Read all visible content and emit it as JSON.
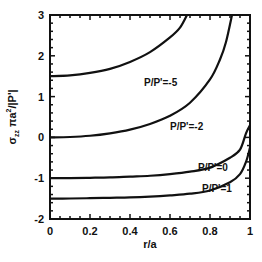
{
  "chart_data": {
    "type": "line",
    "title": "",
    "xlabel": "r/a",
    "ylabel": "σzz πa²/|P'|",
    "ylabel_parts": {
      "sigma": "σ",
      "sub": "zz",
      "mid": " πa",
      "sup": "2",
      "end": "/|P'|"
    },
    "xlim": [
      0,
      1
    ],
    "ylim": [
      -2,
      3
    ],
    "xticks": [
      0,
      0.2,
      0.4,
      0.6,
      0.8,
      1
    ],
    "xtick_labels": [
      "0",
      "0.2",
      "0.4",
      "0.6",
      "0.8",
      "1"
    ],
    "yticks": [
      -2,
      -1,
      0,
      1,
      2,
      3
    ],
    "ytick_labels": [
      "-2",
      "-1",
      "0",
      "1",
      "2",
      "3"
    ],
    "grid": false,
    "legend": "inline labels",
    "series": [
      {
        "name": "P/P'=-5",
        "label": "P/P'=-5",
        "x": [
          0,
          0.1,
          0.2,
          0.3,
          0.4,
          0.5,
          0.6,
          0.65,
          0.685
        ],
        "y": [
          1.5,
          1.52,
          1.58,
          1.68,
          1.85,
          2.09,
          2.45,
          2.69,
          3.0
        ]
      },
      {
        "name": "P/P'=-2",
        "label": "P/P'=-2",
        "x": [
          0,
          0.1,
          0.2,
          0.3,
          0.4,
          0.5,
          0.6,
          0.7,
          0.8,
          0.85,
          0.88,
          0.91
        ],
        "y": [
          0,
          0.01,
          0.04,
          0.1,
          0.19,
          0.33,
          0.53,
          0.85,
          1.42,
          1.91,
          2.34,
          3.0
        ]
      },
      {
        "name": "P/P'=0",
        "label": "P/P'=0",
        "x": [
          0,
          0.1,
          0.2,
          0.3,
          0.4,
          0.5,
          0.6,
          0.7,
          0.8,
          0.9,
          0.95,
          0.98,
          1.0
        ],
        "y": [
          -1,
          -0.998,
          -0.99,
          -0.98,
          -0.96,
          -0.94,
          -0.9,
          -0.84,
          -0.74,
          -0.5,
          -0.3,
          0.1,
          0.3
        ]
      },
      {
        "name": "P/P'=1",
        "label": "P/P'=1",
        "x": [
          0,
          0.1,
          0.2,
          0.3,
          0.4,
          0.5,
          0.6,
          0.7,
          0.8,
          0.9,
          0.95,
          0.98,
          1.0
        ],
        "y": [
          -1.5,
          -1.498,
          -1.49,
          -1.48,
          -1.47,
          -1.45,
          -1.42,
          -1.38,
          -1.3,
          -1.1,
          -0.9,
          -0.6,
          -0.25
        ]
      }
    ]
  }
}
